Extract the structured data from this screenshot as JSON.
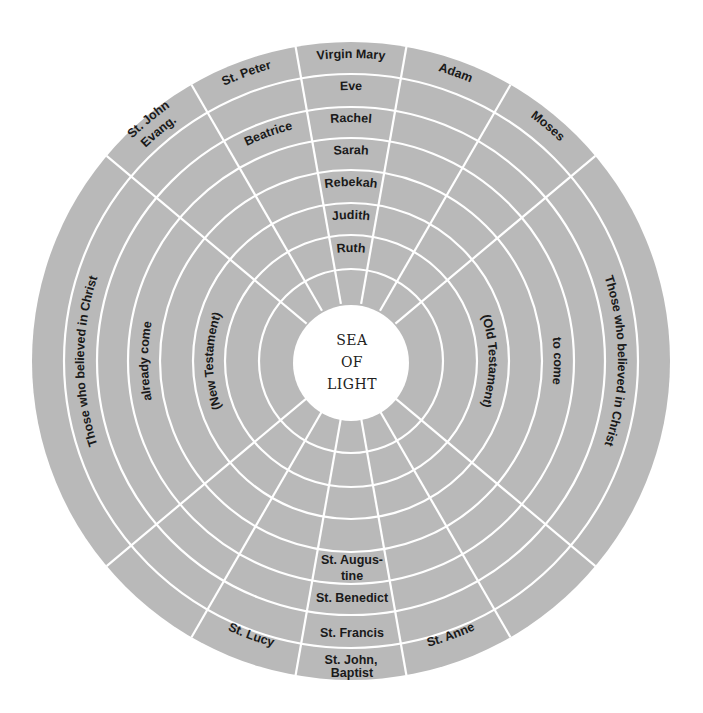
{
  "diagram": {
    "center_label": [
      "SEA",
      "OF",
      "LIGHT"
    ],
    "colors": {
      "fill": "#b9b9b9",
      "lines": "#ffffff",
      "text": "#1a1a1a",
      "background": "#ffffff"
    },
    "geometry": {
      "cx": 351,
      "cy": 361,
      "center_radius": 58,
      "ring_radii": [
        92,
        126,
        158,
        191,
        223,
        254,
        287,
        319
      ],
      "spoke_angles_deg": [
        -50,
        -30,
        -10,
        10,
        30,
        50,
        130,
        150,
        170,
        190,
        210,
        230
      ]
    },
    "top_column": {
      "virgin_mary": "Virgin Mary",
      "eve": "Eve",
      "rachel": "Rachel",
      "sarah": "Sarah",
      "rebekah": "Rebekah",
      "judith": "Judith",
      "ruth": "Ruth"
    },
    "top_left": {
      "st_peter": "St. Peter",
      "beatrice": "Beatrice",
      "st_john_evang_1": "St. John",
      "st_john_evang_2": "Evang."
    },
    "top_right": {
      "adam": "Adam",
      "moses": "Moses"
    },
    "bottom_column": {
      "st_john_baptist_1": "St. John,",
      "st_john_baptist_2": "Baptist",
      "st_francis": "St. Francis",
      "st_benedict": "St. Benedict",
      "st_augustine_1": "St. Augus-",
      "st_augustine_2": "tine"
    },
    "bottom_sides": {
      "st_lucy": "St. Lucy",
      "st_anne": "St. Anne"
    },
    "left_side": {
      "outer": "Those   who   believed   in   Christ",
      "middle": "already   come",
      "inner": "(New   Testament)"
    },
    "right_side": {
      "outer": "Those   who   believed   in   Christ",
      "middle": "to   come",
      "inner": "(Old   Testament)"
    }
  }
}
